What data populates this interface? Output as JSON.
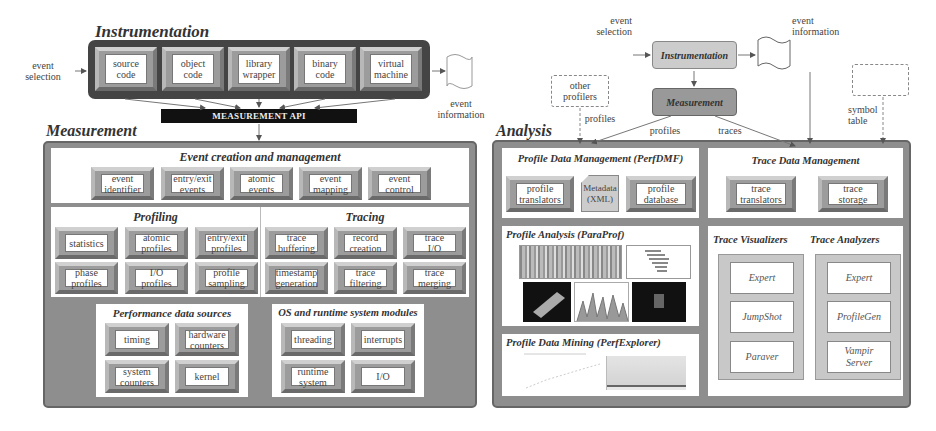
{
  "left": {
    "instrumentation": {
      "title": "Instrumentation",
      "input_label": "event\nselection",
      "output_label": "event\ninformation",
      "items": [
        "source\ncode",
        "object\ncode",
        "library\nwrapper",
        "binary\ncode",
        "virtual\nmachine"
      ]
    },
    "measurement_api": "MEASUREMENT API",
    "measurement": {
      "title": "Measurement",
      "event_creation": {
        "title": "Event creation and management",
        "items": [
          "event\nidentifier",
          "entry/exit\nevents",
          "atomic\nevents",
          "event\nmapping",
          "event\ncontrol"
        ]
      },
      "profiling": {
        "title": "Profiling",
        "items": [
          "statistics",
          "atomic\nprofiles",
          "entry/exit\nprofiles",
          "phase\nprofiles",
          "I/O\nprofiles",
          "profile\nsampling"
        ]
      },
      "tracing": {
        "title": "Tracing",
        "items": [
          "trace\nbuffering",
          "record\ncreation",
          "trace\nI/O",
          "timestamp\ngeneration",
          "trace\nfiltering",
          "trace\nmerging"
        ]
      },
      "perf_sources": {
        "title": "Performance data sources",
        "items": [
          "timing",
          "hardware\ncounters",
          "system\ncounters",
          "kernel"
        ]
      },
      "os_modules": {
        "title": "OS and runtime system modules",
        "items": [
          "threading",
          "interrupts",
          "runtime\nsystem",
          "I/O"
        ]
      }
    }
  },
  "right": {
    "event_selection": "event\nselection",
    "instrumentation": "Instrumentation",
    "event_information": "event\ninformation",
    "measurement": "Measurement",
    "other_profilers": "other\nprofilers",
    "symbol_table": "symbol\ntable",
    "edge_labels": {
      "profiles_other": "profiles",
      "profiles": "profiles",
      "traces": "traces"
    },
    "analysis": {
      "title": "Analysis",
      "perfdmf": {
        "title": "Profile Data Management (PerfDMF)",
        "items": [
          "profile\ntranslators",
          "Metadata\n(XML)",
          "profile\ndatabase"
        ]
      },
      "trace_dm": {
        "title": "Trace Data Management",
        "items": [
          "trace\ntranslators",
          "trace\nstorage"
        ]
      },
      "paraprof": {
        "title": "Profile Analysis (ParaProf)"
      },
      "perfexplorer": {
        "title": "Profile Data Mining (PerfExplorer)"
      },
      "trace_visualizers": {
        "title": "Trace Visualizers",
        "items": [
          "Vampir",
          "JumpShot",
          "Paraver"
        ]
      },
      "trace_analyzers": {
        "title": "Trace Analyzers",
        "items": [
          "Expert",
          "ProfileGen",
          "Vampir\nServer"
        ]
      }
    }
  }
}
